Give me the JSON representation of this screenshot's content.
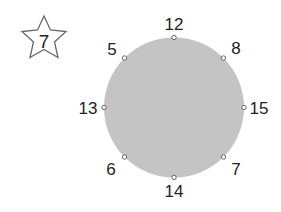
{
  "star": {
    "value": "7",
    "stroke": "#666666"
  },
  "circle": {
    "fill": "#c4c4c4",
    "center": [
      174,
      107.5
    ],
    "radius": 70
  },
  "points": [
    {
      "label": "12",
      "angle": 0
    },
    {
      "label": "8",
      "angle": 45
    },
    {
      "label": "15",
      "angle": 90
    },
    {
      "label": "7",
      "angle": 135
    },
    {
      "label": "14",
      "angle": 180
    },
    {
      "label": "6",
      "angle": 225
    },
    {
      "label": "13",
      "angle": 270
    },
    {
      "label": "5",
      "angle": 315
    }
  ]
}
